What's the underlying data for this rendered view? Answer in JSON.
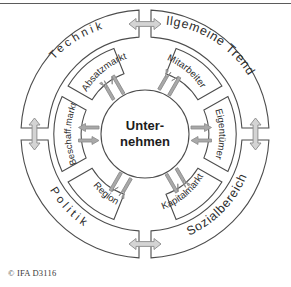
{
  "figure": {
    "type": "concentric-ring-diagram",
    "title_rule": true,
    "caption": "© IFA D3116",
    "center": {
      "line1": "Unter-",
      "line2": "nehmen"
    },
    "outer_ring": {
      "label_role": "external-environment",
      "segments": [
        {
          "id": "technik",
          "label": "Technik",
          "position": "upper-left",
          "spaced": true
        },
        {
          "id": "allgemeine",
          "label": "Allgemeine Trends",
          "position": "upper-right",
          "spaced": false
        },
        {
          "id": "politik",
          "label": "Politik",
          "position": "lower-left",
          "spaced": true
        },
        {
          "id": "sozialbereich",
          "label": "Sozialbereich",
          "position": "lower-right",
          "spaced": false
        }
      ]
    },
    "inner_ring": {
      "label_role": "stakeholders-markets",
      "segments": [
        {
          "id": "absatzmarkt",
          "label": "Absatzmarkt",
          "position": "top-left"
        },
        {
          "id": "mitarbeiter",
          "label": "Mitarbeiter",
          "position": "top-right"
        },
        {
          "id": "eigentuemer",
          "label": "Eigentümer",
          "position": "right"
        },
        {
          "id": "kapitalmarkt",
          "label": "Kapitalmarkt",
          "position": "bottom-right"
        },
        {
          "id": "region",
          "label": "Region",
          "position": "bottom-left"
        },
        {
          "id": "beschaffmarkt",
          "label": "Beschaff.markt",
          "position": "left"
        }
      ]
    },
    "outer_gap_arrows": [
      {
        "id": "arrow-top",
        "orientation": "horizontal",
        "heads": "double"
      },
      {
        "id": "arrow-right",
        "orientation": "vertical",
        "heads": "double"
      },
      {
        "id": "arrow-bottom",
        "orientation": "horizontal",
        "heads": "double"
      },
      {
        "id": "arrow-left",
        "orientation": "vertical",
        "heads": "double"
      }
    ],
    "inner_arrow_pairs": [
      {
        "id": "pair-upper-left",
        "count": 2,
        "directions": [
          "outward",
          "inward"
        ]
      },
      {
        "id": "pair-upper-right",
        "count": 2,
        "directions": [
          "outward",
          "inward"
        ]
      },
      {
        "id": "pair-right",
        "count": 2,
        "directions": [
          "outward",
          "inward"
        ]
      },
      {
        "id": "pair-lower-right",
        "count": 2,
        "directions": [
          "inward",
          "outward"
        ]
      },
      {
        "id": "pair-lower-left",
        "count": 2,
        "directions": [
          "inward",
          "outward"
        ]
      },
      {
        "id": "pair-left",
        "count": 2,
        "directions": [
          "outward",
          "inward"
        ]
      }
    ],
    "colors": {
      "stroke": "#4d4d4d",
      "text": "#2b2b2b",
      "arrow_fill_outer": "#d2d2d2",
      "arrow_fill_inner": "#a8a8a8",
      "arrow_stroke": "#8a8a8a",
      "background": "#ffffff"
    }
  }
}
